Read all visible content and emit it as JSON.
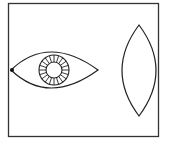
{
  "diagram": {
    "colors": {
      "stroke": "#222222",
      "frame": "#333333",
      "background": "#ffffff"
    },
    "frame": {
      "x": 8.5,
      "y": 3.5,
      "width": 150,
      "height": 133
    },
    "eye": {
      "left_corner": [
        11,
        70
      ],
      "right_corner": [
        98,
        70
      ],
      "top_control_y": 34,
      "bottom_control_y": 106,
      "iris": {
        "cx": 54,
        "cy": 70,
        "outer_r": 15,
        "inner_r": 8,
        "spokes": 20
      },
      "corner_marker": {
        "x": 12,
        "y": 70,
        "r": 2
      }
    },
    "lens": {
      "top": [
        139,
        25
      ],
      "bottom": [
        139,
        116
      ],
      "half_width": 17,
      "type": "biconvex"
    }
  }
}
